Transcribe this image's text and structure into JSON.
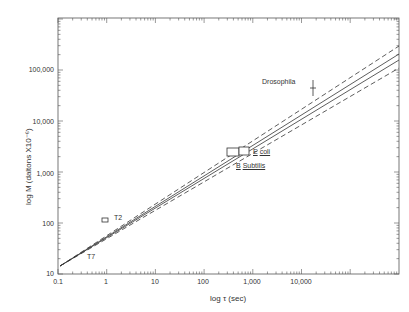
{
  "chart_data": {
    "type": "line",
    "title": "",
    "xlabel": "log τ (sec)",
    "ylabel": "log M (daltons X10⁻⁶)",
    "xscale": "log",
    "yscale": "log",
    "xlim": [
      0.1,
      1000000
    ],
    "ylim": [
      10,
      1000000
    ],
    "grid": false,
    "x_ticks": [
      "0.1",
      "1",
      "10",
      "100",
      "1,000",
      "10,000"
    ],
    "y_ticks": [
      "10",
      "100",
      "1,000",
      "10,000",
      "100,000"
    ],
    "series": [
      {
        "name": "upper bound (dashed)",
        "style": "dashed",
        "x": [
          0.1,
          1000000
        ],
        "y": [
          15,
          320000
        ]
      },
      {
        "name": "fit (solid)",
        "style": "solid",
        "x": [
          0.1,
          1000000
        ],
        "y": [
          15,
          230000
        ]
      },
      {
        "name": "fit 2 (solid)",
        "style": "solid",
        "x": [
          0.1,
          1000000
        ],
        "y": [
          15,
          180000
        ]
      },
      {
        "name": "lower bound (dashed)",
        "style": "dashed",
        "x": [
          0.1,
          1000000
        ],
        "y": [
          15,
          130000
        ]
      }
    ],
    "points": [
      {
        "label": "T7",
        "x": 0.4,
        "y": 25
      },
      {
        "label": "T2",
        "x": 3,
        "y": 110
      },
      {
        "label": "B. Subtilis",
        "x": 40,
        "y": 2500
      },
      {
        "label": "E. coli",
        "x": 60,
        "y": 2600
      },
      {
        "label": "Drosophila",
        "x": 6000,
        "y": 42000
      }
    ],
    "annotations": [
      "T7",
      "T2",
      "E. coli",
      "B. Subtilis",
      "Drosophila"
    ]
  },
  "labels": {
    "y": [
      "100,000",
      "10,000",
      "1,000",
      "100",
      "10"
    ],
    "x": [
      "0.1",
      "1",
      "10",
      "100",
      "1,000",
      "10,000"
    ],
    "xaxis": "log τ (sec)",
    "yaxis": "log M (daltons X10⁻⁶)",
    "t7": "T7",
    "t2": "T2",
    "ecoli_e": "E",
    "ecoli": "coli",
    "bsub_b": "B",
    "bsub": "Subtilis",
    "dros": "Drosophila"
  }
}
